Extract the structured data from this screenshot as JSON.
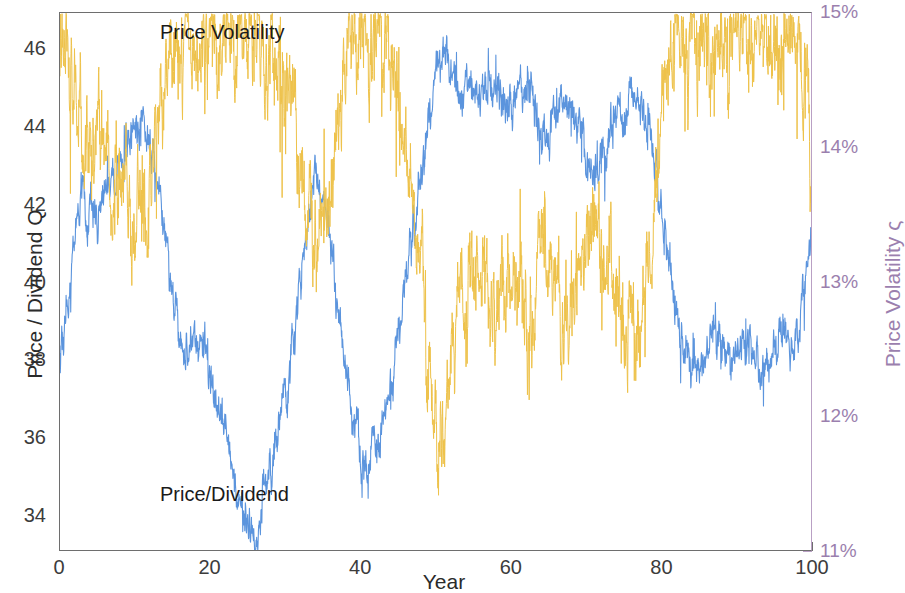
{
  "figure": {
    "width": 888,
    "height": 593,
    "background": "#ffffff"
  },
  "axes": {
    "plot_box": {
      "left": 59,
      "top": 12,
      "width": 753,
      "height": 539
    },
    "left": {
      "title": "Price / Dividend Q",
      "color": "#2b2b2b",
      "ticks": [
        "34",
        "36",
        "38",
        "40",
        "42",
        "44",
        "46"
      ],
      "tick_values": [
        34,
        36,
        38,
        40,
        42,
        44,
        46
      ],
      "range": [
        33.07,
        46.93
      ]
    },
    "right": {
      "title": "Price Volatility ς",
      "color": "#9b7fae",
      "ticks": [
        "11%",
        "12%",
        "13%",
        "14%",
        "15%"
      ],
      "tick_values": [
        11,
        12,
        13,
        14,
        15
      ],
      "range": [
        11.0,
        15.0
      ]
    },
    "x": {
      "title": "Year",
      "color": "#2b2b2b",
      "ticks": [
        "0",
        "20",
        "40",
        "60",
        "80",
        "100"
      ],
      "tick_values": [
        0,
        20,
        40,
        60,
        80,
        100
      ],
      "range": [
        0,
        100
      ]
    }
  },
  "annotations": [
    {
      "name": "price-volatility-label",
      "text": "Price Volatility",
      "x": 100,
      "y": 8
    },
    {
      "name": "price-dividend-label",
      "text": "Price/Dividend",
      "x": 100,
      "y": 470
    }
  ],
  "chart_data": {
    "type": "line",
    "title": "",
    "xlabel": "Year",
    "ylabel": "Price / Dividend Q",
    "y2label": "Price Volatility ς",
    "xlim": [
      0,
      100
    ],
    "ylim": [
      33.07,
      46.93
    ],
    "y2lim": [
      11.0,
      15.0
    ],
    "grid": false,
    "legend_position": "in-plot-annotations",
    "series": [
      {
        "name": "Price/Dividend",
        "axis": "left",
        "color": "#5b94dd",
        "linewidth": 1.1,
        "noise_amplitude": 0.55,
        "seed": 20247,
        "anchors_x": [
          0,
          1,
          2,
          3,
          4,
          5,
          6,
          7,
          8,
          9,
          10,
          11,
          12,
          13,
          14,
          15,
          16,
          17,
          18,
          19,
          20,
          21,
          22,
          23,
          24,
          25,
          26,
          27,
          28,
          29,
          30,
          31,
          32,
          33,
          34,
          35,
          36,
          37,
          38,
          39,
          40,
          41,
          42,
          43,
          44,
          45,
          46,
          47,
          48,
          49,
          50,
          51,
          52,
          53,
          54,
          55,
          56,
          57,
          58,
          59,
          60,
          61,
          62,
          63,
          64,
          65,
          66,
          67,
          68,
          69,
          70,
          71,
          72,
          73,
          74,
          75,
          76,
          77,
          78,
          79,
          80,
          81,
          82,
          83,
          84,
          85,
          86,
          87,
          88,
          89,
          90,
          91,
          92,
          93,
          94,
          95,
          96,
          97,
          98,
          99,
          100
        ],
        "anchors_y": [
          37.9,
          39.4,
          41.2,
          42.3,
          41.8,
          41.5,
          42.2,
          42.6,
          43.1,
          43.6,
          44.0,
          44.2,
          43.6,
          42.4,
          41.0,
          39.6,
          38.6,
          38.3,
          38.5,
          38.3,
          37.6,
          37.0,
          36.2,
          35.2,
          34.3,
          33.7,
          33.6,
          34.3,
          35.2,
          36.1,
          37.2,
          38.4,
          40.2,
          41.7,
          43.0,
          42.2,
          40.9,
          39.3,
          37.8,
          36.7,
          35.8,
          35.4,
          36.0,
          36.5,
          37.4,
          38.9,
          40.2,
          41.6,
          42.8,
          44.1,
          45.5,
          45.9,
          45.4,
          44.9,
          45.2,
          44.7,
          44.5,
          44.9,
          45.0,
          44.6,
          44.3,
          44.9,
          45.1,
          44.5,
          43.5,
          43.9,
          44.3,
          44.6,
          44.4,
          43.9,
          43.2,
          42.8,
          43.4,
          43.9,
          44.2,
          44.5,
          44.8,
          44.6,
          44.2,
          43.0,
          41.5,
          40.1,
          39.0,
          38.4,
          38.0,
          37.7,
          38.2,
          38.6,
          38.3,
          37.9,
          38.1,
          38.6,
          38.2,
          37.8,
          38.0,
          38.5,
          39.0,
          38.4,
          38.8,
          39.8,
          41.4
        ]
      },
      {
        "name": "Price Volatility",
        "axis": "right",
        "color": "#eec24a",
        "linewidth": 1.0,
        "noise_amplitude": 0.38,
        "seed": 98133,
        "anchors_x": [
          0,
          1,
          2,
          3,
          4,
          5,
          6,
          7,
          8,
          9,
          10,
          11,
          12,
          13,
          14,
          15,
          16,
          17,
          18,
          19,
          20,
          21,
          22,
          23,
          24,
          25,
          26,
          27,
          28,
          29,
          30,
          31,
          32,
          33,
          34,
          35,
          36,
          37,
          38,
          39,
          40,
          41,
          42,
          43,
          44,
          45,
          46,
          47,
          48,
          49,
          50,
          51,
          52,
          53,
          54,
          55,
          56,
          57,
          58,
          59,
          60,
          61,
          62,
          63,
          64,
          65,
          66,
          67,
          68,
          69,
          70,
          71,
          72,
          73,
          74,
          75,
          76,
          77,
          78,
          79,
          80,
          81,
          82,
          83,
          84,
          85,
          86,
          87,
          88,
          89,
          90,
          91,
          92,
          93,
          94,
          95,
          96,
          97,
          98,
          99,
          100
        ],
        "anchors_y": [
          14.9,
          14.7,
          14.4,
          14.0,
          14.1,
          14.3,
          14.0,
          13.8,
          13.7,
          13.6,
          13.5,
          13.5,
          13.8,
          14.2,
          14.5,
          14.7,
          14.8,
          14.8,
          14.7,
          14.8,
          14.8,
          14.8,
          14.8,
          14.8,
          14.8,
          14.8,
          14.8,
          14.8,
          14.7,
          14.6,
          14.5,
          14.3,
          13.9,
          13.6,
          13.3,
          13.6,
          13.9,
          14.3,
          14.6,
          14.8,
          14.8,
          14.8,
          14.8,
          14.7,
          14.6,
          14.3,
          14.0,
          13.6,
          13.1,
          12.3,
          11.8,
          12.0,
          12.6,
          13.0,
          12.8,
          13.0,
          13.1,
          12.9,
          12.8,
          13.0,
          13.1,
          12.8,
          12.7,
          13.0,
          13.4,
          13.1,
          12.9,
          12.7,
          12.8,
          13.0,
          13.3,
          13.5,
          13.2,
          13.0,
          12.9,
          12.7,
          12.6,
          12.7,
          12.9,
          13.5,
          14.5,
          14.8,
          14.8,
          14.8,
          14.8,
          14.8,
          14.8,
          14.8,
          14.8,
          14.8,
          14.8,
          14.8,
          14.8,
          14.8,
          14.8,
          14.8,
          14.7,
          14.8,
          14.7,
          14.4,
          13.9
        ]
      }
    ]
  }
}
